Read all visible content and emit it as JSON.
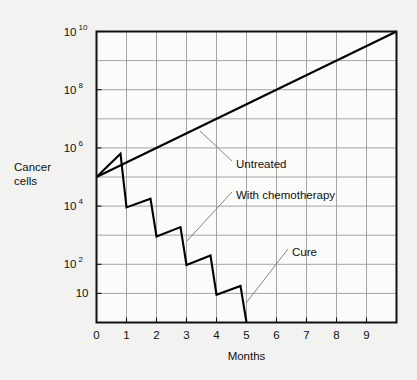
{
  "figure": {
    "background_color": "#f2f2f0",
    "plot_background_color": "#fbfbfa",
    "axis_color": "#111111",
    "grid_color": "#9a9a9a",
    "curve_color": "#000000",
    "leader_color": "#777777"
  },
  "chart_data": {
    "type": "line",
    "title": "",
    "xlabel": "Months",
    "ylabel": "Cancer cells",
    "ylabel_line1": "Cancer",
    "ylabel_line2": "cells",
    "xlim": [
      0,
      10
    ],
    "ylim": [
      1,
      10000000000
    ],
    "yscale": "log",
    "grid": true,
    "legend_position": "inline-annotations",
    "xticks": [
      0,
      1,
      2,
      3,
      4,
      5,
      6,
      7,
      8,
      9
    ],
    "xtick_labels": [
      "0",
      "1",
      "2",
      "3",
      "4",
      "5",
      "6",
      "7",
      "8",
      "9"
    ],
    "yticks": [
      10000000000,
      100000000,
      1000000,
      10000,
      100,
      10
    ],
    "ytick_labels": [
      "10^10",
      "10^8",
      "10^6",
      "10^4",
      "10^2",
      "10"
    ],
    "ytick_mantissa": [
      "10",
      "10",
      "10",
      "10",
      "10",
      "10"
    ],
    "ytick_exponents": [
      "10",
      "8",
      "6",
      "4",
      "2",
      ""
    ],
    "ygrid_decades": [
      10,
      9,
      8,
      7,
      6,
      5,
      4,
      3,
      2,
      1
    ],
    "series": [
      {
        "name": "Untreated",
        "annotation": "Untreated",
        "points": [
          {
            "x": 0,
            "y": 100000
          },
          {
            "x": 10,
            "y": 10000000000
          }
        ]
      },
      {
        "name": "With chemotherapy",
        "annotation": "With chemotherapy",
        "points": [
          {
            "x": 0.0,
            "y": 100000
          },
          {
            "x": 0.8,
            "y": 630000
          },
          {
            "x": 1.0,
            "y": 9000
          },
          {
            "x": 1.8,
            "y": 18000
          },
          {
            "x": 2.0,
            "y": 900
          },
          {
            "x": 2.8,
            "y": 1900
          },
          {
            "x": 3.0,
            "y": 95
          },
          {
            "x": 3.8,
            "y": 200
          },
          {
            "x": 4.0,
            "y": 9
          },
          {
            "x": 4.8,
            "y": 18
          },
          {
            "x": 5.0,
            "y": 1
          }
        ]
      }
    ],
    "annotations": [
      {
        "label": "Untreated",
        "text_x": 4.55,
        "text_y_px": 164,
        "leader_from_x_px": 200,
        "leader_from_y_px": 131,
        "leader_to_x_px": 232,
        "leader_to_y_px": 161
      },
      {
        "label": "With chemotherapy",
        "text_x": 4.55,
        "text_y_px": 195,
        "leader_from_x_px": 186,
        "leader_from_y_px": 242,
        "leader_to_x_px": 232,
        "leader_to_y_px": 192
      },
      {
        "label": "Cure",
        "text_x": 6.45,
        "text_y_px": 252,
        "leader_from_x_px": 246,
        "leader_from_y_px": 303,
        "leader_to_x_px": 288,
        "leader_to_y_px": 249
      }
    ]
  }
}
